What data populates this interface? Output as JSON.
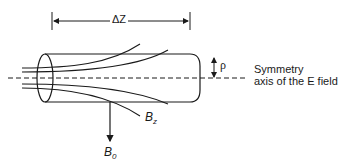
{
  "figure": {
    "type": "physics-schematic",
    "dimension": {
      "label": "ΔZ"
    },
    "radius": {
      "label": "ρ"
    },
    "symmetry_axis": {
      "line1": "Symmetry",
      "line2": "axis of the E field"
    },
    "field_labels": {
      "bz": {
        "base": "B",
        "sub": "z"
      },
      "b0": {
        "base": "B",
        "sub": "0"
      }
    },
    "colors": {
      "stroke": "#1a1a1a",
      "background": "#ffffff"
    }
  }
}
